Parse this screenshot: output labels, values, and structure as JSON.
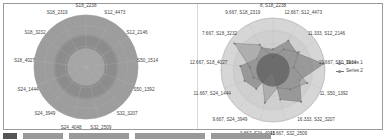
{
  "chart_data": [
    {
      "type": "radar",
      "title": "",
      "categories": [
        "S18_2238",
        "S12_4473",
        "S12_2146",
        "S50_1514",
        "S50_1392",
        "S32_3207",
        "S32_2509",
        "S24_4048",
        "S24_3949",
        "S24_1444",
        "S18_4027",
        "S18_3232",
        "S18_2319"
      ],
      "rings": 5,
      "colors": {
        "outer": "#9b9b9b",
        "mid": "#8a8a8a",
        "inner": "#a3a3a3"
      },
      "legend": []
    },
    {
      "type": "radar",
      "title": "",
      "categories": [
        "S18_2238",
        "S12_4473",
        "S12_2146",
        "S50_1514",
        "S50_1392",
        "S32_3207",
        "S32_2509",
        "S24_4048",
        "S24_3949",
        "S24_1444",
        "S18_4027",
        "S18_3232",
        "S18_2319"
      ],
      "axis_labels": [
        "8, S18_2238",
        "12.667, S12_4473",
        "11.333, S12_2146",
        "19.667, S50_1514",
        "11, S50_1392",
        "16.333, S32_3207",
        "11.667, S32_2509",
        "0.667, S24_4048",
        "9.667, S24_3949",
        "11.667, S24_1444",
        "12.667, S18_4027",
        "7.667, S18_3232",
        "9.667, S18_2319"
      ],
      "ylim": [
        0,
        20
      ],
      "series": [
        {
          "name": "Series 1",
          "values": [
            8,
            12.667,
            11.333,
            19.667,
            11,
            16.333,
            11.667,
            0.667,
            9.667,
            11.667,
            12.667,
            7.667,
            9.667
          ]
        },
        {
          "name": "Series 2",
          "values": [
            5,
            9,
            12,
            8,
            14,
            10,
            7,
            13,
            6,
            8,
            9,
            18,
            11
          ]
        }
      ],
      "legend": {
        "position": "right",
        "entries": [
          "Series 1",
          "Series 2"
        ]
      }
    }
  ],
  "left": {
    "labels": [
      "S18_2238",
      "S12_4473",
      "S12_2146",
      "S50_1514",
      "S50_1392",
      "S32_3207",
      "S32_2509",
      "S24_4048",
      "S24_3949",
      "S24_1444",
      "S18_4027",
      "S18_3232",
      "S18_2319"
    ]
  },
  "right": {
    "labels": [
      "8, S18_2238",
      "12.667, S12_4473",
      "11.333, S12_2146",
      "19.667, S50_1514",
      "11, S50_1392",
      "16.333, S32_3207",
      "11.667, S32_2509",
      "0.667, S24_4048",
      "9.667, S24_3949",
      "11.667, S24_1444",
      "12.667, S18_4027",
      "7.667, S18_3232",
      "9.667, S18_2319"
    ],
    "legend": [
      {
        "label": "Series 1"
      },
      {
        "label": "Series 2"
      }
    ]
  }
}
